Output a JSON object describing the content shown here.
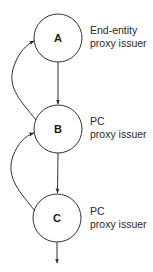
{
  "diagram": {
    "type": "proxy-delegation-chain",
    "colors": {
      "stroke": "#333333",
      "text": "#2a2a2a",
      "background": "#ffffff"
    },
    "nodes": [
      {
        "id": "A",
        "letter": "A",
        "label_line1": "End-entity",
        "label_line2": "proxy issuer"
      },
      {
        "id": "B",
        "letter": "B",
        "label_line1": "PC",
        "label_line2": "proxy issuer"
      },
      {
        "id": "C",
        "letter": "C",
        "label_line1": "PC",
        "label_line2": "proxy issuer"
      }
    ],
    "edges": [
      {
        "from": "A",
        "to": "B",
        "style": "straight"
      },
      {
        "from": "B",
        "to": "C",
        "style": "straight"
      },
      {
        "from": "C",
        "to": "next",
        "style": "straight-out"
      },
      {
        "from": "B",
        "to": "A",
        "style": "curved-back"
      },
      {
        "from": "C",
        "to": "B",
        "style": "curved-back"
      }
    ]
  }
}
